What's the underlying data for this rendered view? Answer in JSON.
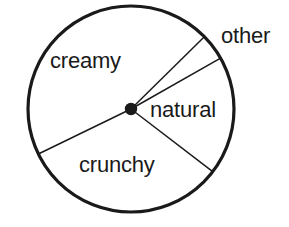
{
  "chart_data": {
    "type": "pie",
    "title": "",
    "subtitle": "",
    "xlabel": "",
    "ylabel": "",
    "grid": false,
    "legend_position": "none",
    "labels_inside": true,
    "center": {
      "x": 131,
      "y": 109
    },
    "radius": 103,
    "categories": [
      "creamy",
      "other",
      "natural",
      "crunchy"
    ],
    "values": [
      52.8,
      4.2,
      18.6,
      24.4
    ],
    "units": "percent",
    "angles_deg": [
      190.0,
      15.0,
      67.0,
      88.0
    ],
    "boundaries_deg": [
      -44.6,
      -29.6,
      37.5,
      154.1
    ],
    "slices": [
      {
        "name": "creamy",
        "label": "creamy",
        "start_deg": 154.1,
        "end_deg": 315.4,
        "sweep_deg": 190.0,
        "value": 52.8,
        "fill": "#ffffff",
        "stroke": "#1a1a1a"
      },
      {
        "name": "other",
        "label": "other",
        "start_deg": -44.6,
        "end_deg": -29.6,
        "sweep_deg": 15.0,
        "value": 4.2,
        "fill": "#ffffff",
        "stroke": "#1a1a1a"
      },
      {
        "name": "natural",
        "label": "natural",
        "start_deg": -29.6,
        "end_deg": 37.5,
        "sweep_deg": 67.0,
        "value": 18.6,
        "fill": "#ffffff",
        "stroke": "#1a1a1a"
      },
      {
        "name": "crunchy",
        "label": "crunchy",
        "start_deg": 37.5,
        "end_deg": 154.1,
        "sweep_deg": 88.0,
        "value": 24.4,
        "fill": "#ffffff",
        "stroke": "#1a1a1a"
      }
    ],
    "colors": {
      "outline": "#1a1a1a",
      "divider": "#1a1a1a",
      "center_dot": "#1a1a1a",
      "background": "#ffffff",
      "text": "#1a1a1a"
    }
  },
  "labels": {
    "creamy": "creamy",
    "other": "other",
    "natural": "natural",
    "crunchy": "crunchy"
  }
}
